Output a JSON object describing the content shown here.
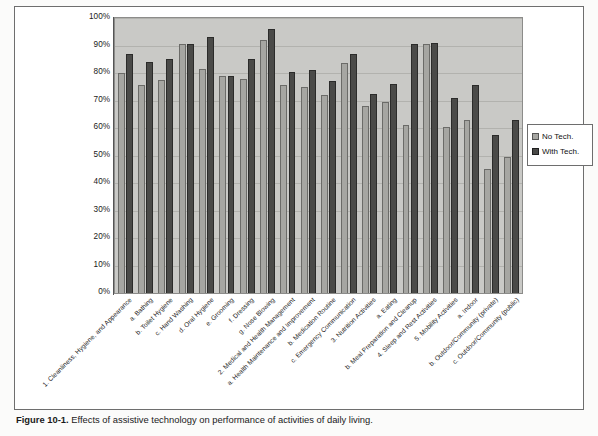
{
  "figure": {
    "caption_bold": "Figure 10-1.",
    "caption_rest": " Effects of assistive technology on performance of activities of daily living."
  },
  "legend": {
    "position": "right",
    "items": [
      {
        "label": "No Tech.",
        "color": "#a6a6a2"
      },
      {
        "label": "With Tech.",
        "color": "#4a4a48"
      }
    ]
  },
  "chart_data": {
    "type": "bar",
    "title": "",
    "xlabel": "",
    "ylabel": "",
    "ylim": [
      0,
      100
    ],
    "yticks": [
      "0%",
      "10%",
      "20%",
      "30%",
      "40%",
      "50%",
      "60%",
      "70%",
      "80%",
      "90%",
      "100%"
    ],
    "ytick_values": [
      0,
      10,
      20,
      30,
      40,
      50,
      60,
      70,
      80,
      90,
      100
    ],
    "grid": true,
    "grid_axis": "y",
    "categories": [
      "1. Cleanliness, Hygiene, and Appearance",
      "a. Bathing",
      "b. Toilet Hygiene",
      "c. Hand Washing",
      "d. Oral Hygiene",
      "e. Grooming",
      "f. Dressing",
      "g. Nose Blowing",
      "2. Medical and Health Management",
      "a. Health Maintenance and Improvement",
      "b. Medication Routine",
      "c. Emergency Communication",
      "3. Nutrition Activities",
      "a. Eating",
      "b. Meal Preparation and Cleanup",
      "4. Sleep and Rest Activities",
      "5. Mobility Activities",
      "a. Indoor",
      "b. Outdoor/Community (private)",
      "c. Outdoor/Community (public)"
    ],
    "series": [
      {
        "name": "No Tech.",
        "color": "#a6a6a2",
        "values": [
          80,
          75.5,
          77.5,
          90.5,
          81.5,
          79,
          78,
          92,
          75.5,
          75,
          72,
          83.5,
          68,
          69.5,
          61,
          90.5,
          60.5,
          63,
          45,
          49.5
        ]
      },
      {
        "name": "With Tech.",
        "color": "#4a4a48",
        "values": [
          87,
          84,
          85,
          90.5,
          93,
          79,
          85,
          96,
          80.5,
          81,
          77,
          87,
          72.5,
          76,
          90.5,
          91,
          71,
          75.5,
          57.5,
          63
        ]
      }
    ]
  }
}
